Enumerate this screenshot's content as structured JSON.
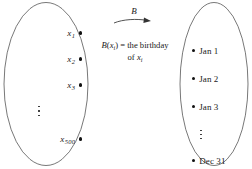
{
  "figure": {
    "stroke_color": "#555555",
    "dot_color": "#111111",
    "background": "#ffffff"
  },
  "domain_set": {
    "name": "people-set",
    "items": [
      {
        "base": "x",
        "sub": "1"
      },
      {
        "base": "x",
        "sub": "2"
      },
      {
        "base": "x",
        "sub": "3"
      },
      {
        "base": "⋮",
        "sub": ""
      },
      {
        "base": "x",
        "sub": "500"
      }
    ]
  },
  "mapping": {
    "arrow_label": "B",
    "description_line1_prefix": "B",
    "description_line1_open": "(",
    "description_line1_var": "x",
    "description_line1_sub": "i",
    "description_line1_close": ")",
    "description_line1_rest": " = the birthday",
    "description_line2_prefix": "of ",
    "description_line2_var": "x",
    "description_line2_sub": "i"
  },
  "codomain_set": {
    "name": "dates-set",
    "items": [
      "Jan 1",
      "Jan 2",
      "Jan 3",
      "⋮",
      "Dec 31"
    ]
  }
}
